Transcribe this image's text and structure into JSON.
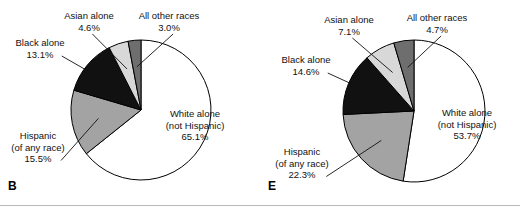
{
  "figure": {
    "background": "#ffffff",
    "outline_color": "#000000",
    "divider_color": "#b9b9b9"
  },
  "palette": {
    "white_alone": "#ffffff",
    "hispanic": "#a3a3a3",
    "black_alone": "#111111",
    "asian_alone": "#d8d8d8",
    "all_other_races": "#6e6e6e"
  },
  "chart_data": [
    {
      "type": "pie",
      "panel": "B",
      "title": "",
      "legend_position": "callout-labels",
      "center": [
        141,
        110
      ],
      "radius": 70,
      "start_angle_deg": 0,
      "direction": "clockwise",
      "categories": [
        "White alone\n(not Hispanic)",
        "Hispanic\n(of any race)",
        "Black alone",
        "Asian alone",
        "All other races"
      ],
      "values": [
        65.1,
        15.5,
        13.1,
        4.6,
        3.0
      ],
      "value_labels": [
        "65.1%",
        "15.5%",
        "13.1%",
        "4.6%",
        "3.0%"
      ],
      "colors": [
        "#ffffff",
        "#a3a3a3",
        "#111111",
        "#d8d8d8",
        "#6e6e6e"
      ],
      "labels": [
        {
          "name": "white-alone",
          "line1": "White alone",
          "line2": "(not Hispanic)",
          "line3": "65.1%",
          "x": 152,
          "y": 108,
          "w": 86,
          "align": "center",
          "leader": false
        },
        {
          "name": "hispanic",
          "line1": "Hispanic",
          "line2": "(of any race)",
          "line3": "15.5%",
          "x": 2,
          "y": 130,
          "w": 72,
          "align": "center",
          "leader": true
        },
        {
          "name": "black-alone",
          "line1": "Black alone",
          "line2": "13.1%",
          "line3": "",
          "x": 6,
          "y": 37,
          "w": 68,
          "align": "center",
          "leader": true
        },
        {
          "name": "asian-alone",
          "line1": "Asian alone",
          "line2": "4.6%",
          "line3": "",
          "x": 55,
          "y": 10,
          "w": 68,
          "align": "center",
          "leader": true
        },
        {
          "name": "all-other-races",
          "line1": "All other races",
          "line2": "3.0%",
          "line3": "",
          "x": 128,
          "y": 10,
          "w": 82,
          "align": "center",
          "leader": true
        }
      ]
    },
    {
      "type": "pie",
      "panel": "E",
      "title": "",
      "legend_position": "callout-labels",
      "center": [
        414,
        111
      ],
      "radius": 71,
      "start_angle_deg": 0,
      "direction": "clockwise",
      "categories": [
        "White alone\n(not Hispanic)",
        "Hispanic\n(of any race)",
        "Black alone",
        "Asian alone",
        "All other races"
      ],
      "values": [
        53.7,
        22.3,
        14.6,
        7.1,
        4.7
      ],
      "value_labels": [
        "53.7%",
        "22.3%",
        "14.6%",
        "7.1%",
        "4.7%"
      ],
      "colors": [
        "#ffffff",
        "#a3a3a3",
        "#111111",
        "#d8d8d8",
        "#6e6e6e"
      ],
      "labels": [
        {
          "name": "white-alone",
          "line1": "White alone",
          "line2": "(not Hispanic)",
          "line3": "53.7%",
          "x": 424,
          "y": 107,
          "w": 86,
          "align": "center",
          "leader": false
        },
        {
          "name": "hispanic",
          "line1": "Hispanic",
          "line2": "(of any race)",
          "line3": "22.3%",
          "x": 264,
          "y": 146,
          "w": 76,
          "align": "center",
          "leader": true
        },
        {
          "name": "black-alone",
          "line1": "Black alone",
          "line2": "14.6%",
          "line3": "",
          "x": 272,
          "y": 54,
          "w": 68,
          "align": "center",
          "leader": true
        },
        {
          "name": "asian-alone",
          "line1": "Asian alone",
          "line2": "7.1%",
          "line3": "",
          "x": 315,
          "y": 14,
          "w": 68,
          "align": "center",
          "leader": true
        },
        {
          "name": "all-other-races",
          "line1": "All other races",
          "line2": "4.7%",
          "line3": "",
          "x": 396,
          "y": 12,
          "w": 82,
          "align": "center",
          "leader": true
        }
      ]
    }
  ],
  "panels": {
    "left_letter": "B",
    "right_letter": "E"
  }
}
